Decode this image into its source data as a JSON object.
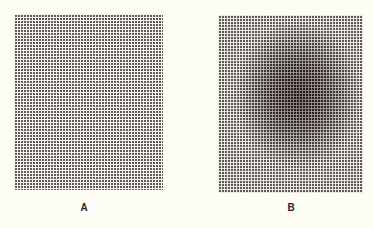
{
  "figure": {
    "panels": [
      {
        "id": "A",
        "label": "A",
        "description": "uniform halftone dot grid"
      },
      {
        "id": "B",
        "label": "B",
        "description": "halftone dot grid with dark elliptical blob near center"
      }
    ]
  }
}
